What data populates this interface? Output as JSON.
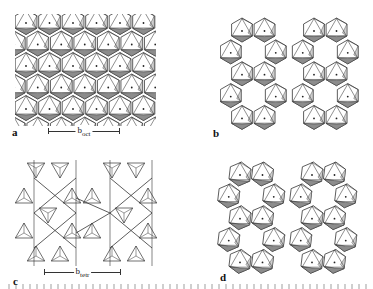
{
  "figure": {
    "panels": [
      {
        "id": "a",
        "label": "a",
        "type": "octahedral-sheet",
        "scale_label": "b",
        "scale_sub": "oct"
      },
      {
        "id": "b",
        "label": "b",
        "type": "octahedral-sheet-with-vacancies"
      },
      {
        "id": "c",
        "label": "c",
        "type": "tetrahedral-sheet",
        "scale_label": "b",
        "scale_sub": "tetr"
      },
      {
        "id": "d",
        "label": "d",
        "type": "distorted-octahedral-sheet"
      }
    ],
    "caption_visible": false
  },
  "colors": {
    "line": "#333333",
    "shade_dark": "#8c8c8c",
    "shade_light": "#cfcfcf",
    "face": "#ffffff",
    "background": "#ffffff"
  }
}
